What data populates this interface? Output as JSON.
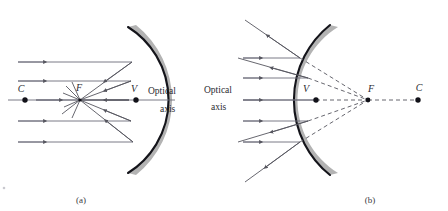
{
  "figure": {
    "background_color": "#ffffff",
    "mirror_band_color": "#b3b3b3",
    "mirror_face_color": "#14141a",
    "ray_color": "#6b6b78",
    "label_color": "#2a2a30",
    "width": 448,
    "height": 211
  },
  "panels": [
    {
      "id": "a",
      "caption": "(a)",
      "mirror_type": "concave",
      "points": [
        {
          "name": "center-of-curvature",
          "label": "C",
          "x": 25,
          "y": 100
        },
        {
          "name": "focal-point",
          "label": "F",
          "x": 80,
          "y": 100
        },
        {
          "name": "vertex",
          "label": "V",
          "x": 136,
          "y": 100
        }
      ],
      "axis_label_line1": "Optical",
      "axis_label_line2": "axis",
      "incoming_ray_count": 5,
      "rays_parallel_to_axis": true,
      "reflected_rays_converge_at": "F",
      "reflected_rays_dashed": false
    },
    {
      "id": "b",
      "caption": "(b)",
      "mirror_type": "convex",
      "points": [
        {
          "name": "vertex",
          "label": "V",
          "x": 316,
          "y": 100
        },
        {
          "name": "focal-point",
          "label": "F",
          "x": 368,
          "y": 100
        },
        {
          "name": "center-of-curvature",
          "label": "C",
          "x": 418,
          "y": 100
        }
      ],
      "axis_label_line1": "Optical",
      "axis_label_line2": "axis",
      "incoming_ray_count": 5,
      "rays_parallel_to_axis": true,
      "reflected_rays_diverge_appearing_from": "F",
      "reflected_rays_dashed": true
    }
  ],
  "labels": {
    "panel_a_C": "C",
    "panel_a_F": "F",
    "panel_a_V": "V",
    "panel_a_optical": "Optical",
    "panel_a_axis": "axis",
    "panel_a_caption": "(a)",
    "panel_b_V": "V",
    "panel_b_F": "F",
    "panel_b_C": "C",
    "panel_b_optical": "Optical",
    "panel_b_axis": "axis",
    "panel_b_caption": "(b)"
  }
}
